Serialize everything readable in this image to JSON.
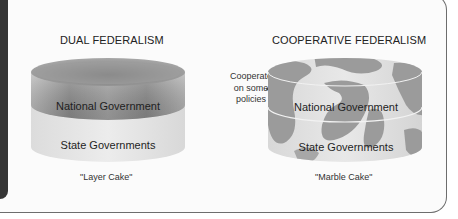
{
  "diagram": {
    "left_panel": {
      "title": "DUAL FEDERALISM",
      "layers": {
        "top": "National Government",
        "bottom": "State Governments"
      },
      "caption": "\"Layer Cake\""
    },
    "right_panel": {
      "title": "COOPERATIVE FEDERALISM",
      "annotation": {
        "line1": "Cooperate",
        "line2": "on some",
        "line3": "policies"
      },
      "layers": {
        "top": "National Government",
        "bottom": "State Governments"
      },
      "caption": "\"Marble Cake\""
    },
    "colors": {
      "national_layer": "#8a8a8a",
      "state_layer": "#e4e4e4",
      "marble_swirl": "#9a9a9a",
      "frame_border": "#6d6d6d",
      "side_bar": "#353535"
    }
  }
}
